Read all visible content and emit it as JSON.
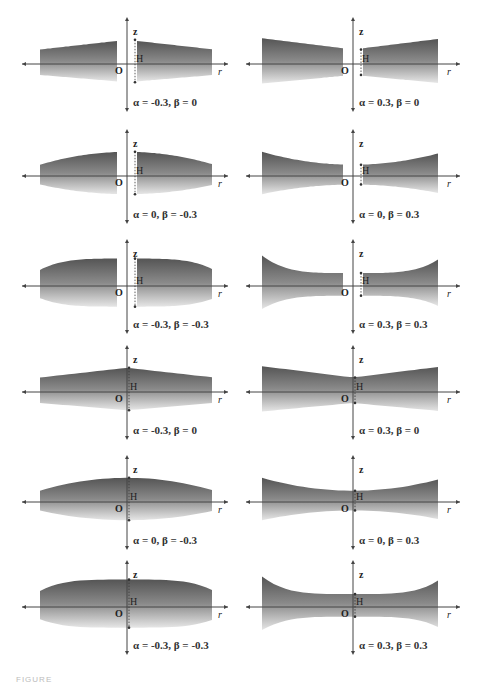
{
  "figure": {
    "caption_fragment": "FIGURE",
    "fill_colors": {
      "top": "#555555",
      "middle": "#8a8a8a",
      "bottom": "#e6e6e6"
    },
    "axis_labels": {
      "vertical": "z",
      "horizontal": "r",
      "origin": "O",
      "height_marker": "H"
    },
    "panels": [
      {
        "id": "r1c1",
        "row": 1,
        "col": 1,
        "label": "α = -0.3, β = 0",
        "alpha": -0.3,
        "beta": 0,
        "gap": true,
        "shape": "linear"
      },
      {
        "id": "r1c2",
        "row": 1,
        "col": 2,
        "label": "α = 0.3, β = 0",
        "alpha": 0.3,
        "beta": 0,
        "gap": true,
        "shape": "linear"
      },
      {
        "id": "r2c1",
        "row": 2,
        "col": 1,
        "label": "α = 0, β = -0.3",
        "alpha": 0,
        "beta": -0.3,
        "gap": true,
        "shape": "convex"
      },
      {
        "id": "r2c2",
        "row": 2,
        "col": 2,
        "label": "α = 0, β = 0.3",
        "alpha": 0,
        "beta": 0.3,
        "gap": true,
        "shape": "concave"
      },
      {
        "id": "r3c1",
        "row": 3,
        "col": 1,
        "label": "α = -0.3, β = -0.3",
        "alpha": -0.3,
        "beta": -0.3,
        "gap": true,
        "shape": "convex-strong"
      },
      {
        "id": "r3c2",
        "row": 3,
        "col": 2,
        "label": "α = 0.3, β = 0.3",
        "alpha": 0.3,
        "beta": 0.3,
        "gap": true,
        "shape": "concave-strong"
      },
      {
        "id": "r4c1",
        "row": 4,
        "col": 1,
        "label": "α = -0.3, β = 0",
        "alpha": -0.3,
        "beta": 0,
        "gap": false,
        "shape": "linear"
      },
      {
        "id": "r4c2",
        "row": 4,
        "col": 2,
        "label": "α = 0.3, β = 0",
        "alpha": 0.3,
        "beta": 0,
        "gap": false,
        "shape": "linear"
      },
      {
        "id": "r5c1",
        "row": 5,
        "col": 1,
        "label": "α = 0, β = -0.3",
        "alpha": 0,
        "beta": -0.3,
        "gap": false,
        "shape": "convex"
      },
      {
        "id": "r5c2",
        "row": 5,
        "col": 2,
        "label": "α = 0, β = 0.3",
        "alpha": 0,
        "beta": 0.3,
        "gap": false,
        "shape": "concave"
      },
      {
        "id": "r6c1",
        "row": 6,
        "col": 1,
        "label": "α = -0.3, β = -0.3",
        "alpha": -0.3,
        "beta": -0.3,
        "gap": false,
        "shape": "convex-strong"
      },
      {
        "id": "r6c2",
        "row": 6,
        "col": 2,
        "label": "α = 0.3, β = 0.3",
        "alpha": 0.3,
        "beta": 0.3,
        "gap": false,
        "shape": "concave-strong"
      }
    ]
  }
}
